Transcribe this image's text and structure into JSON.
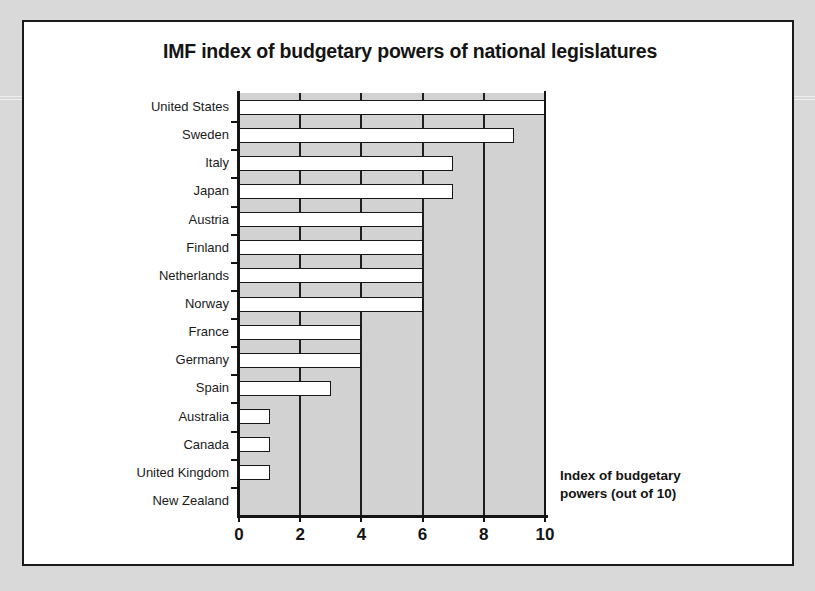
{
  "chart_data": {
    "type": "bar",
    "orientation": "horizontal",
    "title": "IMF index of budgetary powers of national legislatures",
    "xlabel": "",
    "ylabel": "",
    "xlim": [
      0,
      10
    ],
    "xticks": [
      0,
      2,
      4,
      6,
      8,
      10
    ],
    "xtick_labels": [
      "0",
      "2",
      "4",
      "6",
      "8",
      "10"
    ],
    "grid": true,
    "grid_axis": "x",
    "legend": false,
    "categories": [
      "United States",
      "Sweden",
      "Italy",
      "Japan",
      "Austria",
      "Finland",
      "Netherlands",
      "Norway",
      "France",
      "Germany",
      "Spain",
      "Australia",
      "Canada",
      "United Kingdom",
      "New Zealand"
    ],
    "values": [
      10,
      9,
      7,
      7,
      6,
      6,
      6,
      6,
      4,
      4,
      3,
      1,
      1,
      1,
      0
    ],
    "annotations": [
      "Index of budgetary",
      "powers (out of 10)"
    ],
    "colors": {
      "plot_background": "#d2d2d2",
      "bar_fill": "#ffffff",
      "bar_stroke": "#171717",
      "axis": "#141414",
      "card_background": "#ffffff",
      "page_background": "#d9d9d9"
    }
  }
}
